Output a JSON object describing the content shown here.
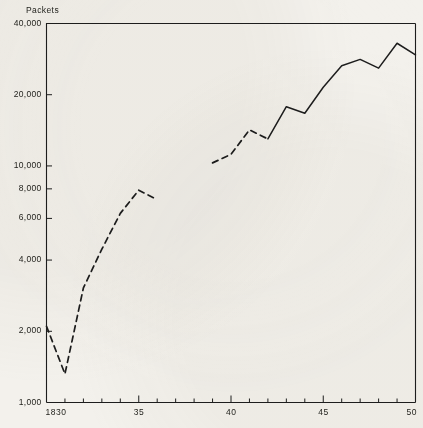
{
  "figure": {
    "background_color": "#f3f1ec",
    "ink_color": "#1d1d1d",
    "y_axis_title": "Packets"
  },
  "chart_data": {
    "type": "line",
    "title": "",
    "subtitle": "",
    "xlabel": "",
    "ylabel": "Packets",
    "yscale": "log",
    "ylim": [
      1000,
      40000
    ],
    "xlim": [
      1830,
      1850
    ],
    "grid": false,
    "legend": "none",
    "y_ticks": [
      {
        "value": 40000,
        "label": "40,000"
      },
      {
        "value": 20000,
        "label": "20,000"
      },
      {
        "value": 10000,
        "label": "10,000"
      },
      {
        "value": 8000,
        "label": "8,000"
      },
      {
        "value": 6000,
        "label": "6,000"
      },
      {
        "value": 4000,
        "label": "4,000"
      },
      {
        "value": 2000,
        "label": "2,000"
      },
      {
        "value": 1000,
        "label": "1,000"
      }
    ],
    "x_ticks": [
      {
        "value": 1830,
        "label": "1830"
      },
      {
        "value": 1835,
        "label": "35"
      },
      {
        "value": 1840,
        "label": "40"
      },
      {
        "value": 1845,
        "label": "45"
      },
      {
        "value": 1850,
        "label": "50"
      }
    ],
    "x_minor_tick_interval": 1,
    "series": [
      {
        "name": "early-period",
        "style": "dashed",
        "x": [
          1830,
          1831,
          1832,
          1833,
          1834,
          1835,
          1836
        ],
        "values": [
          2100,
          1320,
          3050,
          4450,
          6300,
          7900,
          7200
        ]
      },
      {
        "name": "later-period-estimated",
        "style": "dashed",
        "x": [
          1839,
          1840,
          1841,
          1842
        ],
        "values": [
          10300,
          11200,
          14200,
          13000
        ]
      },
      {
        "name": "later-period",
        "style": "solid",
        "x": [
          1842,
          1843,
          1844,
          1845,
          1846,
          1847,
          1848,
          1849,
          1850
        ],
        "values": [
          13000,
          17800,
          16700,
          21500,
          26500,
          28200,
          25900,
          33000,
          29500
        ]
      }
    ]
  }
}
